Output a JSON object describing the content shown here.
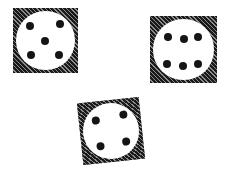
{
  "scene": {
    "description": "Hand-drawn sketch of three dice faces on white background",
    "background": "#ffffff",
    "ink": "#1a1a1a"
  },
  "dice": [
    {
      "name": "die-five",
      "value": 5,
      "x": 13,
      "y": 8,
      "size": 65,
      "rotation": 0,
      "pips": [
        [
          26,
          28
        ],
        [
          72,
          25
        ],
        [
          49,
          50
        ],
        [
          27,
          73
        ],
        [
          71,
          72
        ]
      ]
    },
    {
      "name": "die-six",
      "value": 6,
      "x": 150,
      "y": 16,
      "size": 67,
      "rotation": 0,
      "pips": [
        [
          27,
          32
        ],
        [
          50,
          34
        ],
        [
          72,
          31
        ],
        [
          26,
          71
        ],
        [
          49,
          74
        ],
        [
          71,
          72
        ]
      ]
    },
    {
      "name": "die-four",
      "value": 4,
      "x": 80,
      "y": 100,
      "size": 62,
      "rotation": -6,
      "pips": [
        [
          28,
          30
        ],
        [
          72,
          26
        ],
        [
          30,
          72
        ],
        [
          73,
          70
        ]
      ]
    }
  ]
}
